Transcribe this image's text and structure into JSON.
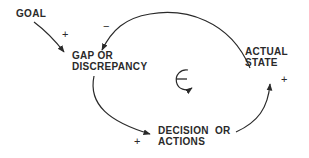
{
  "diagram": {
    "type": "causal-loop",
    "loop_polarity": "−",
    "nodes": [
      {
        "id": "goal",
        "lines": [
          "GOAL"
        ]
      },
      {
        "id": "gap",
        "lines": [
          "GAP OR",
          "DISCREPANCY"
        ]
      },
      {
        "id": "actual",
        "lines": [
          "ACTUAL",
          "STATE"
        ]
      },
      {
        "id": "decision",
        "lines": [
          "DECISION  OR",
          "ACTIONS"
        ]
      }
    ],
    "links": [
      {
        "from": "goal",
        "to": "gap",
        "sign": "+"
      },
      {
        "from": "actual",
        "to": "gap",
        "sign": "−"
      },
      {
        "from": "gap",
        "to": "decision",
        "sign": "+"
      },
      {
        "from": "decision",
        "to": "actual",
        "sign": "+"
      }
    ]
  },
  "colors": {
    "ink": "#2a2a2a",
    "background": "#ffffff"
  }
}
